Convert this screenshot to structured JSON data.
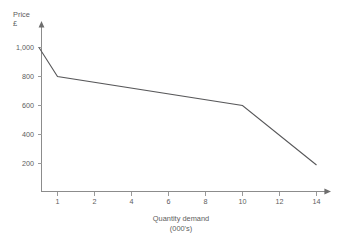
{
  "chart_data": {
    "type": "line",
    "title": "",
    "subtitle": "",
    "xlabel": "Quantity demand",
    "xlabel_sub": "(000's)",
    "ylabel": "Price",
    "ylabel_sub": "£",
    "x_tick_labels": [
      "1",
      "2",
      "4",
      "6",
      "8",
      "10",
      "12",
      "14"
    ],
    "x_tick_values": [
      1,
      2,
      4,
      6,
      8,
      10,
      12,
      14
    ],
    "y_tick_labels": [
      "200",
      "400",
      "600",
      "800",
      "1,000"
    ],
    "y_tick_values": [
      200,
      400,
      600,
      800,
      1000
    ],
    "ylim": [
      0,
      1100
    ],
    "grid": false,
    "legend": false,
    "legend_position": "none",
    "axis_spacing": "categorical-even",
    "series": [
      {
        "name": "Demand curve",
        "color": "#58585a",
        "x": [
          0.5,
          1,
          10,
          14
        ],
        "values": [
          1000,
          800,
          600,
          190
        ],
        "points": [
          {
            "quantity": 0.5,
            "price": 1000
          },
          {
            "quantity": 1,
            "price": 800
          },
          {
            "quantity": 10,
            "price": 600
          },
          {
            "quantity": 14,
            "price": 190
          }
        ]
      }
    ],
    "annotations": []
  },
  "axes": {
    "y_axis_arrow": "arrow-up",
    "x_axis_arrow": "arrow-right"
  },
  "colors": {
    "background": "#ffffff",
    "axis": "#8c8c8c",
    "text": "#5d5d5d",
    "line": "#58585a"
  }
}
